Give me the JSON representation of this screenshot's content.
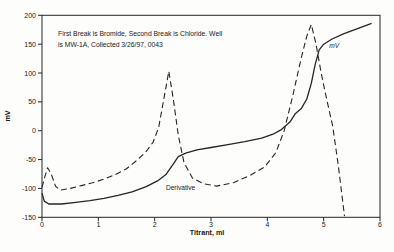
{
  "figure": {
    "annotation_line1": "First Break is Bromide, Second Break is Chloride.  Well",
    "annotation_line2": "is MW-1A, Collected 3/26/97, 0043"
  },
  "colors": {
    "curve": "#262626",
    "text": "#1a1a1a",
    "background": "#fdfdfc"
  },
  "chart_data": {
    "type": "line",
    "title": "",
    "xlabel": "Titrant, ml",
    "ylabel": "mV",
    "xlim": [
      0,
      6
    ],
    "ylim": [
      -150,
      200
    ],
    "x_ticks": [
      0,
      1,
      2,
      3,
      4,
      5,
      6
    ],
    "y_ticks": [
      200,
      150,
      100,
      50,
      0,
      -50,
      -100,
      -150
    ],
    "grid": false,
    "legend_position": "inline-labels",
    "series": [
      {
        "name": "mV",
        "label": "mV",
        "style": "solid",
        "label_italic": true,
        "label_pos": [
          5.1,
          143
        ],
        "points": [
          [
            0,
            -108
          ],
          [
            0.04,
            -122
          ],
          [
            0.12,
            -127
          ],
          [
            0.35,
            -127
          ],
          [
            0.6,
            -124
          ],
          [
            0.85,
            -121
          ],
          [
            1.1,
            -117
          ],
          [
            1.35,
            -112
          ],
          [
            1.6,
            -106
          ],
          [
            1.85,
            -97
          ],
          [
            2.05,
            -87
          ],
          [
            2.2,
            -76
          ],
          [
            2.32,
            -59
          ],
          [
            2.42,
            -45
          ],
          [
            2.55,
            -39
          ],
          [
            2.75,
            -33
          ],
          [
            3,
            -29
          ],
          [
            3.3,
            -24
          ],
          [
            3.6,
            -19
          ],
          [
            3.9,
            -13
          ],
          [
            4.1,
            -6
          ],
          [
            4.25,
            2
          ],
          [
            4.4,
            15
          ],
          [
            4.5,
            30
          ],
          [
            4.6,
            38
          ],
          [
            4.7,
            55
          ],
          [
            4.78,
            82
          ],
          [
            4.85,
            115
          ],
          [
            4.92,
            140
          ],
          [
            5,
            150
          ],
          [
            5.15,
            159
          ],
          [
            5.35,
            168
          ],
          [
            5.6,
            177
          ],
          [
            5.85,
            186
          ]
        ]
      },
      {
        "name": "Derivative",
        "label": "Derivative",
        "style": "dashed",
        "label_italic": false,
        "label_pos": [
          2.2,
          -102
        ],
        "points": [
          [
            0,
            -98
          ],
          [
            0.05,
            -80
          ],
          [
            0.1,
            -64
          ],
          [
            0.16,
            -74
          ],
          [
            0.24,
            -96
          ],
          [
            0.32,
            -103
          ],
          [
            0.5,
            -100
          ],
          [
            0.7,
            -95
          ],
          [
            0.9,
            -90
          ],
          [
            1.1,
            -84
          ],
          [
            1.3,
            -76
          ],
          [
            1.5,
            -66
          ],
          [
            1.7,
            -50
          ],
          [
            1.85,
            -36
          ],
          [
            1.97,
            -20
          ],
          [
            2.07,
            5
          ],
          [
            2.15,
            48
          ],
          [
            2.25,
            103
          ],
          [
            2.33,
            55
          ],
          [
            2.42,
            -8
          ],
          [
            2.52,
            -55
          ],
          [
            2.67,
            -82
          ],
          [
            2.87,
            -92
          ],
          [
            3.1,
            -96
          ],
          [
            3.4,
            -90
          ],
          [
            3.7,
            -77
          ],
          [
            3.95,
            -63
          ],
          [
            4.15,
            -38
          ],
          [
            4.3,
            0
          ],
          [
            4.45,
            60
          ],
          [
            4.6,
            125
          ],
          [
            4.7,
            164
          ],
          [
            4.78,
            184
          ],
          [
            4.86,
            152
          ],
          [
            4.96,
            98
          ],
          [
            5.06,
            52
          ],
          [
            5.16,
            8
          ],
          [
            5.26,
            -60
          ],
          [
            5.37,
            -148
          ]
        ]
      }
    ]
  }
}
